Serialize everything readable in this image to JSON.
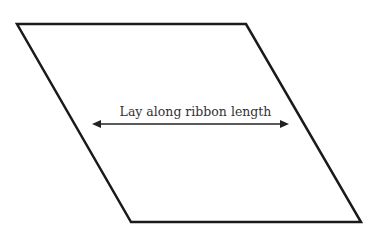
{
  "diagram": {
    "shape": "parallelogram",
    "stroke_color": "#1a1a1a",
    "arrow": {
      "type": "double-headed",
      "label": "Lay along ribbon length"
    }
  }
}
